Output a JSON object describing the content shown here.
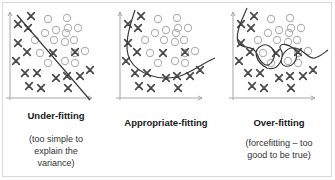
{
  "panels": [
    {
      "id": "under",
      "title": "Under-fitting",
      "caption": "(too simple to explain the variance)",
      "caption_lines": [
        "(too simple to",
        "explain the",
        "variance)"
      ],
      "fit": "line"
    },
    {
      "id": "appropriate",
      "title": "Appropriate-fitting",
      "caption": "",
      "caption_lines": [],
      "fit": "curve"
    },
    {
      "id": "over",
      "title": "Over-fitting",
      "caption": "(forcefitting -- too good to be true)",
      "caption_lines": [
        "(forcefitting – too",
        "good to be true)"
      ],
      "fit": "overfit-curve"
    }
  ],
  "points": {
    "x_marks": [
      [
        31,
        16
      ],
      [
        18,
        24
      ],
      [
        28,
        28
      ],
      [
        18,
        43
      ],
      [
        27,
        52
      ],
      [
        16,
        61
      ],
      [
        25,
        73
      ],
      [
        37,
        73
      ],
      [
        56,
        78
      ],
      [
        67,
        76
      ],
      [
        80,
        76
      ],
      [
        90,
        70
      ],
      [
        29,
        86
      ],
      [
        41,
        88
      ],
      [
        68,
        88
      ],
      [
        53,
        53
      ],
      [
        75,
        52
      ]
    ],
    "o_marks": [
      [
        48,
        19
      ],
      [
        67,
        18
      ],
      [
        56,
        30
      ],
      [
        68,
        28
      ],
      [
        78,
        28
      ],
      [
        45,
        33
      ],
      [
        66,
        33
      ],
      [
        35,
        40
      ],
      [
        54,
        40
      ],
      [
        65,
        42
      ],
      [
        74,
        40
      ],
      [
        85,
        51
      ],
      [
        40,
        53
      ],
      [
        48,
        63
      ],
      [
        65,
        61
      ],
      [
        75,
        63
      ],
      [
        75,
        53
      ]
    ]
  },
  "colors": {
    "x_mark": "#4a4a4a",
    "o_mark": "#b3b3b3",
    "axis": "#a6a6a6",
    "fit_line": "#3a3a3a",
    "border": "#d9d9d9"
  }
}
